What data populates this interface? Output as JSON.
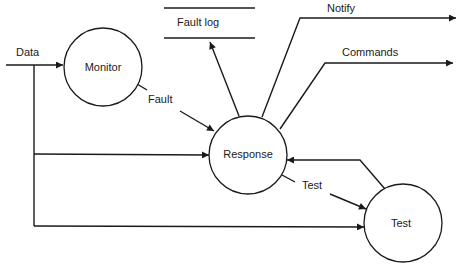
{
  "diagram": {
    "type": "data-flow",
    "processes": [
      {
        "id": "monitor",
        "label": "Monitor"
      },
      {
        "id": "response",
        "label": "Response"
      },
      {
        "id": "test",
        "label": "Test"
      }
    ],
    "store": {
      "label": "Fault log"
    },
    "flows": {
      "data": "Data",
      "fault": "Fault",
      "notify": "Notify",
      "commands": "Commands",
      "test": "Test"
    }
  }
}
